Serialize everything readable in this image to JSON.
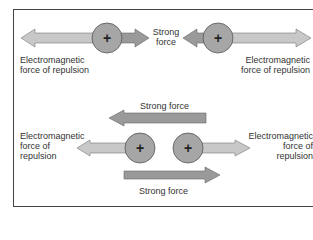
{
  "colors": {
    "light_arrow": "#c8c8c8",
    "dark_arrow": "#9a9a9a",
    "nucleus": "#a6a6a6",
    "outline": "#555555",
    "frame": "#444444"
  },
  "top_panel": {
    "left_label_line1": "Electromagnetic",
    "left_label_line2": "force of repulsion",
    "center_label_line1": "Strong",
    "center_label_line2": "force",
    "right_label_line1": "Electromagnetic",
    "right_label_line2": "force of repulsion",
    "nucleus_symbol": "+"
  },
  "bottom_panel": {
    "top_arrow_label": "Strong force",
    "bottom_arrow_label": "Strong force",
    "left_label_line1": "Electromagnetic",
    "left_label_line2": "force of",
    "left_label_line3": "repulsion",
    "right_label_line1": "Electromagnetic",
    "right_label_line2": "force of",
    "right_label_line3": "repulsion",
    "nucleus_symbol": "+"
  }
}
